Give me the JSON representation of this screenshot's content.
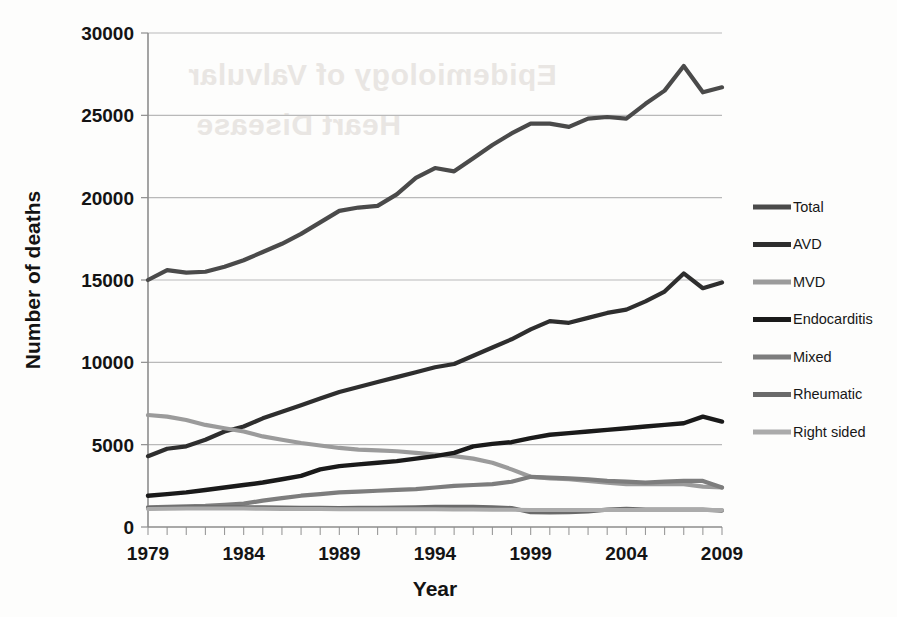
{
  "figure": {
    "background_watermark": [
      "Epidemiology of Valvular",
      "Heart Disease"
    ]
  },
  "chart_data": {
    "type": "line",
    "title": "",
    "xlabel": "Year",
    "ylabel": "Number of deaths",
    "xlim": [
      1979,
      2009
    ],
    "ylim": [
      0,
      30000
    ],
    "grid": true,
    "legend_position": "right",
    "x_tick_labels": [
      "1979",
      "1984",
      "1989",
      "1994",
      "1999",
      "2004",
      "2009"
    ],
    "x_tick_values": [
      1979,
      1984,
      1989,
      1994,
      1999,
      2004,
      2009
    ],
    "x_minor_tick_step": 1,
    "y_tick_labels": [
      "0",
      "5000",
      "10000",
      "15000",
      "20000",
      "25000",
      "30000"
    ],
    "y_tick_values": [
      0,
      5000,
      10000,
      15000,
      20000,
      25000,
      30000
    ],
    "x": [
      1979,
      1980,
      1981,
      1982,
      1983,
      1984,
      1985,
      1986,
      1987,
      1988,
      1989,
      1990,
      1991,
      1992,
      1993,
      1994,
      1995,
      1996,
      1997,
      1998,
      1999,
      2000,
      2001,
      2002,
      2003,
      2004,
      2005,
      2006,
      2007,
      2008,
      2009
    ],
    "series": [
      {
        "name": "Total",
        "color": "#4a4a4a",
        "width": 4.2,
        "values": [
          15000,
          15600,
          15450,
          15500,
          15800,
          16200,
          16700,
          17200,
          17800,
          18500,
          19200,
          19400,
          19500,
          20200,
          21200,
          21800,
          21600,
          22400,
          23200,
          23900,
          24500,
          24500,
          24300,
          24800,
          24900,
          24800,
          25700,
          26500,
          28000,
          26400,
          26700
        ]
      },
      {
        "name": "AVD",
        "color": "#2e2e2e",
        "width": 4.2,
        "values": [
          4300,
          4750,
          4900,
          5300,
          5800,
          6100,
          6600,
          7000,
          7400,
          7800,
          8200,
          8500,
          8800,
          9100,
          9400,
          9700,
          9900,
          10400,
          10900,
          11400,
          12000,
          12500,
          12400,
          12700,
          13000,
          13200,
          13700,
          14300,
          15400,
          14500,
          14850
        ]
      },
      {
        "name": "MVD",
        "color": "#9b9b9b",
        "width": 4.2,
        "values": [
          6800,
          6700,
          6500,
          6200,
          6000,
          5800,
          5500,
          5300,
          5100,
          4950,
          4800,
          4700,
          4650,
          4600,
          4500,
          4400,
          4300,
          4150,
          3900,
          3500,
          3050,
          2950,
          2900,
          2800,
          2700,
          2600,
          2600,
          2600,
          2600,
          2450,
          2400
        ]
      },
      {
        "name": "Endocarditis",
        "color": "#1a1a1a",
        "width": 4.4,
        "values": [
          1900,
          2000,
          2100,
          2250,
          2400,
          2550,
          2700,
          2900,
          3100,
          3500,
          3700,
          3800,
          3900,
          4000,
          4150,
          4300,
          4500,
          4900,
          5050,
          5150,
          5400,
          5600,
          5700,
          5800,
          5900,
          6000,
          6100,
          6200,
          6300,
          6700,
          6400
        ]
      },
      {
        "name": "Mixed",
        "color": "#7d7d7d",
        "width": 4.2,
        "values": [
          1200,
          1220,
          1250,
          1280,
          1350,
          1420,
          1600,
          1750,
          1900,
          2000,
          2100,
          2150,
          2200,
          2250,
          2300,
          2400,
          2500,
          2550,
          2600,
          2750,
          3050,
          3000,
          2950,
          2900,
          2800,
          2750,
          2700,
          2750,
          2800,
          2800,
          2400
        ]
      },
      {
        "name": "Rheumatic",
        "color": "#6a6a6a",
        "width": 4.2,
        "values": [
          1150,
          1180,
          1190,
          1200,
          1200,
          1200,
          1190,
          1180,
          1170,
          1160,
          1150,
          1160,
          1170,
          1180,
          1200,
          1220,
          1230,
          1220,
          1200,
          1150,
          900,
          880,
          900,
          950,
          1050,
          1100,
          1050,
          1050,
          1050,
          1050,
          1000
        ]
      },
      {
        "name": "Right sided",
        "color": "#ababab",
        "width": 4.0,
        "values": [
          1100,
          1110,
          1120,
          1120,
          1120,
          1120,
          1110,
          1100,
          1100,
          1090,
          1080,
          1080,
          1080,
          1080,
          1080,
          1080,
          1070,
          1060,
          1050,
          1040,
          1030,
          1030,
          1030,
          1030,
          1030,
          1030,
          1030,
          1030,
          1030,
          1030,
          1030
        ]
      }
    ],
    "legend_entries": [
      {
        "label": "Total",
        "color": "#4a4a4a"
      },
      {
        "label": "AVD",
        "color": "#2e2e2e"
      },
      {
        "label": "MVD",
        "color": "#9b9b9b"
      },
      {
        "label": "Endocarditis",
        "color": "#1a1a1a"
      },
      {
        "label": "Mixed",
        "color": "#7d7d7d"
      },
      {
        "label": "Rheumatic",
        "color": "#6a6a6a"
      },
      {
        "label": "Right sided",
        "color": "#ababab"
      }
    ]
  }
}
